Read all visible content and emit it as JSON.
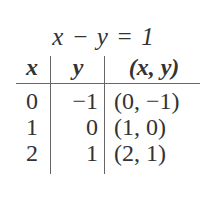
{
  "equation": "x − y = 1",
  "table": {
    "headers": [
      "x",
      "y",
      "(x, y)"
    ],
    "rows": [
      [
        "0",
        "−1",
        "(0, −1)"
      ],
      [
        "1",
        "0",
        "(1, 0)"
      ],
      [
        "2",
        "1",
        "(2, 1)"
      ]
    ]
  }
}
